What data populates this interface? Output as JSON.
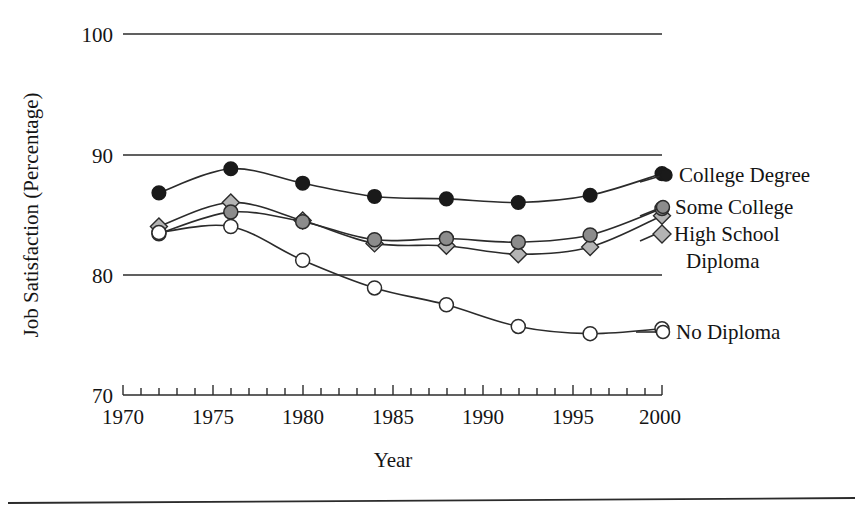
{
  "chart_data": {
    "type": "line",
    "title": "",
    "subtitle": "",
    "xlabel": "Year",
    "ylabel": "Job Satisfaction (Percentage)",
    "xlim": [
      1970,
      2000
    ],
    "ylim": [
      70,
      100
    ],
    "grid": true,
    "grid_axis": "y",
    "legend_position": "right",
    "x": [
      1972,
      1976,
      1980,
      1984,
      1988,
      1992,
      1996,
      2000
    ],
    "xtick_labels": [
      "1970",
      "1975",
      "1980",
      "1985",
      "1990",
      "1995",
      "2000"
    ],
    "xtick_values": [
      1970,
      1975,
      1980,
      1985,
      1990,
      1995,
      2000
    ],
    "xtick_minor_step": 1,
    "ytick_labels": [
      "70",
      "80",
      "90",
      "100"
    ],
    "ytick_values": [
      70,
      80,
      90,
      100
    ],
    "series": [
      {
        "name": "College Degree",
        "marker": "filled-circle",
        "marker_color": "#1a1a1a",
        "line_color": "#2b2b2b",
        "values": [
          86.8,
          88.8,
          87.6,
          86.5,
          86.3,
          86.0,
          86.6,
          88.4
        ]
      },
      {
        "name": "Some College",
        "marker": "gray-circle",
        "marker_color": "#8c8c8c",
        "line_color": "#2b2b2b",
        "values": [
          83.4,
          85.2,
          84.4,
          82.9,
          83.0,
          82.7,
          83.3,
          85.5
        ]
      },
      {
        "name": "High School Diploma",
        "marker": "gray-diamond",
        "marker_color": "#b4b4b4",
        "line_color": "#2b2b2b",
        "values": [
          84.0,
          86.0,
          84.5,
          82.6,
          82.4,
          81.7,
          82.3,
          84.9
        ]
      },
      {
        "name": "No Diploma",
        "marker": "open-circle",
        "marker_color": "#ffffff",
        "line_color": "#2b2b2b",
        "values": [
          83.5,
          84.0,
          81.2,
          78.9,
          77.5,
          75.7,
          75.1,
          75.5
        ]
      }
    ]
  },
  "legend": {
    "entries": [
      {
        "label": "College Degree",
        "marker": "filled-circle"
      },
      {
        "label": "Some College",
        "marker": "gray-circle"
      },
      {
        "label": "High School",
        "marker": "gray-diamond"
      },
      {
        "label": "Diploma",
        "marker": "none"
      },
      {
        "label": "No Diploma",
        "marker": "open-circle"
      }
    ]
  },
  "axes": {
    "ytick_0": "70",
    "ytick_1": "80",
    "ytick_2": "90",
    "ytick_3": "100",
    "xtick_0": "1970",
    "xtick_1": "1975",
    "xtick_2": "1980",
    "xtick_3": "1985",
    "xtick_4": "1990",
    "xtick_5": "1995",
    "xtick_6": "2000",
    "xlabel": "Year",
    "ylabel": "Job Satisfaction (Percentage)"
  },
  "colors": {
    "ink": "#2b2b2b",
    "college_marker": "#1a1a1a",
    "some_college_marker": "#8c8c8c",
    "high_school_marker": "#b4b4b4",
    "no_diploma_marker": "#ffffff"
  }
}
